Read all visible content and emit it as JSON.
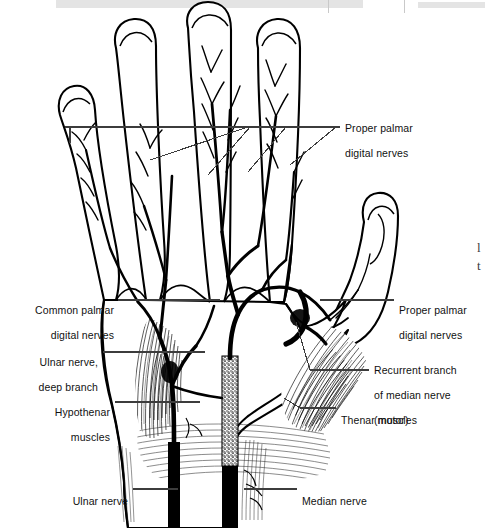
{
  "figure": {
    "view": "anterior (palmar) view of right hand",
    "style": "black-and-white line drawing with hatched muscle shading",
    "ink_color": "#000000",
    "background_color": "#ffffff",
    "leader_line_color": "#3c3c3c"
  },
  "page_artifacts": {
    "top_bar_left_text": "",
    "top_bar_right_text": "",
    "margin_glyph_1": "l",
    "margin_glyph_2": "t"
  },
  "labels": [
    {
      "id": "proper-palmar-digital-nerves-top",
      "line1": "Proper palmar",
      "line2": "digital nerves",
      "align": "left",
      "x": 345,
      "y": 110,
      "anchor_x": 340,
      "anchor_y": 127
    },
    {
      "id": "common-palmar-digital-nerves",
      "line1": "Common palmar",
      "line2": "digital nerves",
      "align": "right",
      "x": 12,
      "y": 292,
      "anchor_x": 135,
      "anchor_y": 300
    },
    {
      "id": "proper-palmar-digital-nerves-right",
      "line1": "Proper palmar",
      "line2": "digital nerves",
      "align": "left",
      "x": 399,
      "y": 292,
      "anchor_x": 394,
      "anchor_y": 300
    },
    {
      "id": "ulnar-nerve-deep-branch",
      "line1": "Ulnar nerve,",
      "line2": "deep branch",
      "align": "right",
      "x": 22,
      "y": 344,
      "anchor_x": 122,
      "anchor_y": 352
    },
    {
      "id": "recurrent-branch-median-nerve",
      "line1": "Recurrent branch",
      "line2": "of median nerve",
      "line3": "(motor)",
      "align": "left",
      "x": 374,
      "y": 352,
      "anchor_x": 369,
      "anchor_y": 370
    },
    {
      "id": "hypothenar-muscles",
      "line1": "Hypothenar",
      "line2": "muscles",
      "align": "right",
      "x": 35,
      "y": 394,
      "anchor_x": 124,
      "anchor_y": 402
    },
    {
      "id": "thenar-muscles",
      "line1": "Thenar muscles",
      "align": "left",
      "x": 341,
      "y": 402,
      "anchor_x": 336,
      "anchor_y": 408
    },
    {
      "id": "ulnar-nerve",
      "line1": "Ulnar nerve",
      "align": "right",
      "x": 60,
      "y": 483,
      "anchor_x": 133,
      "anchor_y": 489
    },
    {
      "id": "median-nerve",
      "line1": "Median nerve",
      "align": "left",
      "x": 302,
      "y": 483,
      "anchor_x": 297,
      "anchor_y": 489
    }
  ],
  "anatomy_parts": [
    "index finger",
    "middle finger",
    "ring finger",
    "little finger",
    "thumb",
    "palm",
    "wrist",
    "thenar eminence muscles",
    "hypothenar eminence muscles",
    "median nerve trunk",
    "ulnar nerve trunk",
    "common palmar digital nerves",
    "proper palmar digital nerves",
    "recurrent (motor) branch of median nerve",
    "deep branch of ulnar nerve"
  ]
}
